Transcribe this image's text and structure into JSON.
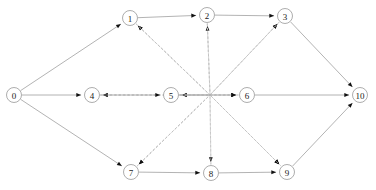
{
  "diagram": {
    "type": "node-link-diagram",
    "canvas": {
      "width": 376,
      "height": 190,
      "background": "#ffffff"
    },
    "style": {
      "solid_edge_color": "#9a9a9a",
      "dashed_edge_color": "#c2c2c2",
      "node_stroke_color": "#8a8a8a",
      "node_fill_color": "#ffffff",
      "arrowhead_color": "#111111",
      "label_color": "#1a1a1a",
      "node_radius": 7.5
    },
    "hub": {
      "name": "edge-crossing-point",
      "x": 210,
      "y": 95
    },
    "nodes": [
      {
        "id": "0",
        "label": "0",
        "x": 14,
        "y": 95,
        "row": "source"
      },
      {
        "id": "1",
        "label": "1",
        "x": 130,
        "y": 18,
        "row": "top"
      },
      {
        "id": "2",
        "label": "2",
        "x": 207,
        "y": 15,
        "row": "top"
      },
      {
        "id": "3",
        "label": "3",
        "x": 285,
        "y": 16,
        "row": "top"
      },
      {
        "id": "4",
        "label": "4",
        "x": 92,
        "y": 95,
        "row": "middle"
      },
      {
        "id": "5",
        "label": "5",
        "x": 171,
        "y": 95,
        "row": "middle"
      },
      {
        "id": "6",
        "label": "6",
        "x": 247,
        "y": 95,
        "row": "middle"
      },
      {
        "id": "7",
        "label": "7",
        "x": 131,
        "y": 172,
        "row": "bottom"
      },
      {
        "id": "8",
        "label": "8",
        "x": 211,
        "y": 173,
        "row": "bottom"
      },
      {
        "id": "9",
        "label": "9",
        "x": 287,
        "y": 172,
        "row": "bottom"
      },
      {
        "id": "10",
        "label": "10",
        "x": 360,
        "y": 95,
        "row": "sink"
      }
    ],
    "solid_edges": [
      {
        "from": "0",
        "to": "1"
      },
      {
        "from": "0",
        "to": "4"
      },
      {
        "from": "0",
        "to": "7"
      },
      {
        "from": "1",
        "to": "2"
      },
      {
        "from": "2",
        "to": "3"
      },
      {
        "from": "4",
        "to": "5"
      },
      {
        "from": "5",
        "to": "6"
      },
      {
        "from": "7",
        "to": "8"
      },
      {
        "from": "8",
        "to": "9"
      },
      {
        "from": "3",
        "to": "10"
      },
      {
        "from": "6",
        "to": "10"
      },
      {
        "from": "9",
        "to": "10"
      }
    ],
    "dashed_edges": [
      {
        "from": "5",
        "to": "1"
      },
      {
        "from": "7",
        "to": "1"
      },
      {
        "from": "8",
        "to": "2"
      },
      {
        "from": "5",
        "to": "3"
      },
      {
        "from": "7",
        "to": "3"
      },
      {
        "from": "1",
        "to": "5"
      },
      {
        "from": "2",
        "to": "5"
      },
      {
        "from": "3",
        "to": "6"
      },
      {
        "from": "2",
        "to": "6"
      },
      {
        "from": "1",
        "to": "7"
      },
      {
        "from": "2",
        "to": "8"
      },
      {
        "from": "3",
        "to": "9"
      },
      {
        "from": "6",
        "to": "9"
      },
      {
        "from": "4",
        "to": "9"
      },
      {
        "from": "9",
        "to": "4"
      },
      {
        "from": "8",
        "to": "4"
      },
      {
        "from": "6",
        "to": "7"
      }
    ]
  }
}
